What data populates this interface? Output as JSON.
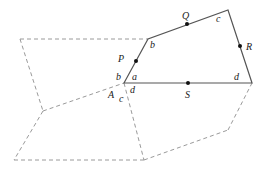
{
  "diagram": {
    "type": "geometry-tiling",
    "solid_quadrilateral": {
      "vertices": [
        [
          124,
          83
        ],
        [
          148,
          39
        ],
        [
          228,
          10
        ],
        [
          252,
          83
        ]
      ],
      "stroke": "#555555"
    },
    "dashed_lines": [
      [
        [
          20,
          39
        ],
        [
          148,
          39
        ]
      ],
      [
        [
          20,
          39
        ],
        [
          43,
          111
        ]
      ],
      [
        [
          43,
          111
        ],
        [
          124,
          83
        ]
      ],
      [
        [
          43,
          111
        ],
        [
          14,
          160
        ]
      ],
      [
        [
          14,
          160
        ],
        [
          144,
          160
        ]
      ],
      [
        [
          124,
          83
        ],
        [
          144,
          160
        ]
      ],
      [
        [
          144,
          160
        ],
        [
          228,
          130
        ]
      ],
      [
        [
          228,
          130
        ],
        [
          252,
          83
        ]
      ]
    ],
    "dashed_color": "#9a9a9a",
    "points": [
      {
        "name": "P",
        "x": 136,
        "y": 61,
        "label_x": 118,
        "label_y": 54
      },
      {
        "name": "Q",
        "x": 187,
        "y": 24,
        "label_x": 182,
        "label_y": 11
      },
      {
        "name": "R",
        "x": 240,
        "y": 46,
        "label_x": 246,
        "label_y": 42
      },
      {
        "name": "S",
        "x": 188,
        "y": 83,
        "label_x": 185,
        "label_y": 90
      }
    ],
    "vertex_labels": [
      {
        "text": "A",
        "x": 108,
        "y": 90
      },
      {
        "text": "a",
        "x": 132,
        "y": 72
      },
      {
        "text": "b",
        "x": 116,
        "y": 72
      },
      {
        "text": "b",
        "x": 150,
        "y": 40
      },
      {
        "text": "c",
        "x": 216,
        "y": 14
      },
      {
        "text": "c",
        "x": 119,
        "y": 94
      },
      {
        "text": "d",
        "x": 130,
        "y": 85
      },
      {
        "text": "d",
        "x": 234,
        "y": 72
      }
    ]
  }
}
